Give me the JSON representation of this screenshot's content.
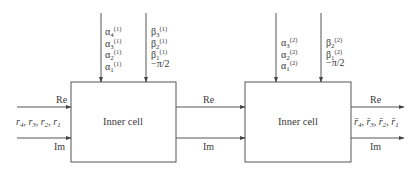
{
  "diagram": {
    "type": "block-diagram",
    "cells": [
      {
        "id": "cell1",
        "label": "Inner cell",
        "alpha_inputs": [
          {
            "sym": "α",
            "sub": "4",
            "sup": "(1)"
          },
          {
            "sym": "α",
            "sub": "3",
            "sup": "(1)"
          },
          {
            "sym": "α",
            "sub": "2",
            "sup": "(1)"
          },
          {
            "sym": "α",
            "sub": "1",
            "sup": "(1)"
          }
        ],
        "beta_inputs": [
          {
            "sym": "β",
            "sub": "3",
            "sup": "(1)"
          },
          {
            "sym": "β",
            "sub": "2",
            "sup": "(1)"
          },
          {
            "sym": "β",
            "sub": "1",
            "sup": "(1)"
          },
          {
            "sym": "−π/2",
            "sub": "",
            "sup": ""
          }
        ]
      },
      {
        "id": "cell2",
        "label": "Inner cell",
        "alpha_inputs": [
          {
            "sym": "α",
            "sub": "3",
            "sup": "(2)"
          },
          {
            "sym": "α",
            "sub": "2",
            "sup": "(2)"
          },
          {
            "sym": "α",
            "sub": "1",
            "sup": "(2)"
          }
        ],
        "beta_inputs": [
          {
            "sym": "β",
            "sub": "2",
            "sup": "(2)"
          },
          {
            "sym": "β",
            "sub": "1",
            "sup": "(2)"
          },
          {
            "sym": "−π/2",
            "sub": "",
            "sup": ""
          }
        ]
      }
    ],
    "input": {
      "re_label": "Re",
      "im_label": "Im",
      "signals": [
        {
          "sym": "r",
          "sub": "4"
        },
        {
          "sym": "r",
          "sub": "3"
        },
        {
          "sym": "r",
          "sub": "2"
        },
        {
          "sym": "r",
          "sub": "1"
        }
      ]
    },
    "between": {
      "re_label": "Re",
      "im_label": "Im"
    },
    "output": {
      "re_label": "Re",
      "im_label": "Im",
      "signals": [
        {
          "sym": "r̄",
          "sub": "4"
        },
        {
          "sym": "r̄",
          "sub": "3"
        },
        {
          "sym": "r̄",
          "sub": "2"
        },
        {
          "sym": "r̄",
          "sub": "1"
        }
      ]
    },
    "colors": {
      "line": "#555555",
      "text": "#3a3a3a",
      "background": "#ffffff"
    }
  }
}
